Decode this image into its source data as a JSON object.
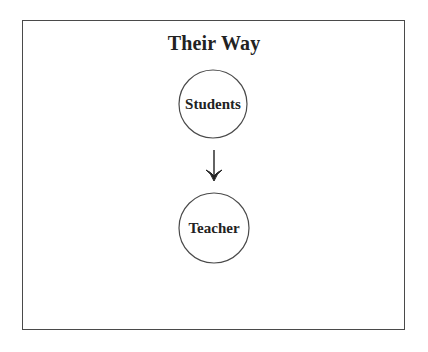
{
  "title": "Their Way",
  "nodes": [
    {
      "id": "students",
      "label": "Students",
      "cx": 213,
      "cy": 104,
      "r": 34
    },
    {
      "id": "teacher",
      "label": "Teacher",
      "cx": 214,
      "cy": 228,
      "r": 35
    }
  ],
  "edges": [
    {
      "from": "students",
      "to": "teacher",
      "direction": "down",
      "arrow-icon": "arrow-down-icon"
    }
  ],
  "colors": {
    "stroke": "#4a4a4a",
    "text": "#222222",
    "background": "#ffffff"
  }
}
